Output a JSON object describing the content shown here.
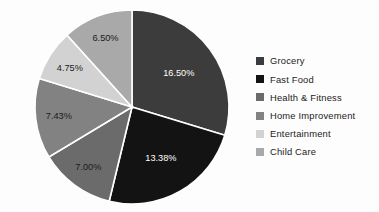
{
  "chart_data": {
    "type": "pie",
    "title": "",
    "subtitle": "",
    "xlabel": "",
    "ylabel": "",
    "grid": false,
    "legend_position": "right",
    "start_angle_deg": 0,
    "direction": "clockwise",
    "value_unit": "%",
    "total_labeled_percent": 55.56,
    "categories": [
      "Grocery",
      "Fast Food",
      "Health & Fitness",
      "Home Improvement",
      "Entertainment",
      "Child Care"
    ],
    "values": [
      16.5,
      13.38,
      7.0,
      7.43,
      4.75,
      6.5
    ],
    "labels": [
      "16.50%",
      "13.38%",
      "7.00%",
      "7.43%",
      "4.75%",
      "6.50%"
    ],
    "colors": [
      "#3c3c3c",
      "#131313",
      "#6b6b6b",
      "#828282",
      "#d2d2d2",
      "#a9a9a9"
    ],
    "label_colors": [
      "#ffffff",
      "#ffffff",
      "#1b1b1b",
      "#1b1b1b",
      "#1b1b1b",
      "#1b1b1b"
    ],
    "slices": [
      {
        "name": "Grocery",
        "value": 16.5,
        "label": "16.50%",
        "color": "#3c3c3c",
        "label_color": "#ffffff"
      },
      {
        "name": "Fast Food",
        "value": 13.38,
        "label": "13.38%",
        "color": "#131313",
        "label_color": "#ffffff"
      },
      {
        "name": "Health & Fitness",
        "value": 7.0,
        "label": "7.00%",
        "color": "#6b6b6b",
        "label_color": "#1b1b1b"
      },
      {
        "name": "Home Improvement",
        "value": 7.43,
        "label": "7.43%",
        "color": "#828282",
        "label_color": "#1b1b1b"
      },
      {
        "name": "Entertainment",
        "value": 4.75,
        "label": "4.75%",
        "color": "#d2d2d2",
        "label_color": "#1b1b1b"
      },
      {
        "name": "Child Care",
        "value": 6.5,
        "label": "6.50%",
        "color": "#a9a9a9",
        "label_color": "#1b1b1b"
      }
    ]
  },
  "legend": {
    "items": [
      {
        "label": "Grocery",
        "color": "#3c3c3c"
      },
      {
        "label": "Fast Food",
        "color": "#131313"
      },
      {
        "label": "Health & Fitness",
        "color": "#6b6b6b"
      },
      {
        "label": "Home Improvement",
        "color": "#828282"
      },
      {
        "label": "Entertainment",
        "color": "#d2d2d2"
      },
      {
        "label": "Child Care",
        "color": "#a9a9a9"
      }
    ]
  },
  "style": {
    "background": "#fdfdfd",
    "slice_border": "#ffffff"
  }
}
